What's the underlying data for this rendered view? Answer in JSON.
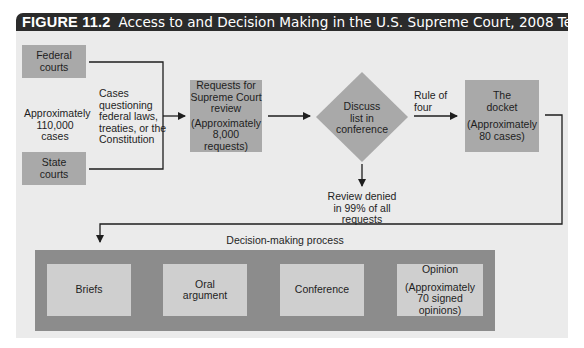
{
  "figure": {
    "label": "FIGURE 11.2",
    "title": "Access to and Decision Making in the U.S. Supreme Court, 2008 Term"
  },
  "sources": {
    "federal": [
      "Federal",
      "courts"
    ],
    "state": [
      "State",
      "courts"
    ],
    "volume": [
      "Approximately",
      "110,000 cases"
    ],
    "cases_desc": [
      "Cases",
      "questioning",
      "federal laws,",
      "treaties, or the",
      "Constitution"
    ]
  },
  "requests_box": {
    "title": [
      "Requests for",
      "Supreme Court",
      "review"
    ],
    "count": [
      "(Approximately",
      "8,000 requests)"
    ]
  },
  "conference_diamond": {
    "label": [
      "Discuss",
      "list in",
      "conference"
    ]
  },
  "rule_of_four": [
    "Rule of",
    "four"
  ],
  "review_denied": [
    "Review denied",
    "in 99% of all requests"
  ],
  "docket_box": {
    "title": [
      "The",
      "docket"
    ],
    "count": [
      "(Approximately",
      "80 cases)"
    ]
  },
  "decision_process": {
    "label": "Decision-making process",
    "steps": [
      {
        "lines": [
          "Briefs"
        ]
      },
      {
        "lines": [
          "Oral",
          "argument"
        ]
      },
      {
        "lines": [
          "Conference"
        ]
      },
      {
        "lines": [
          "Opinion"
        ],
        "sub": [
          "(Approximately",
          "70 signed opinions)"
        ]
      }
    ]
  },
  "colors": {
    "title_bar": "#2b2b2b",
    "panel_bg": "#ebebeb",
    "box_fill": "#a9a9a9",
    "band_fill": "#8c8c8c",
    "inner_box_fill": "#cfcfcf",
    "line": "#1e1e1e"
  }
}
